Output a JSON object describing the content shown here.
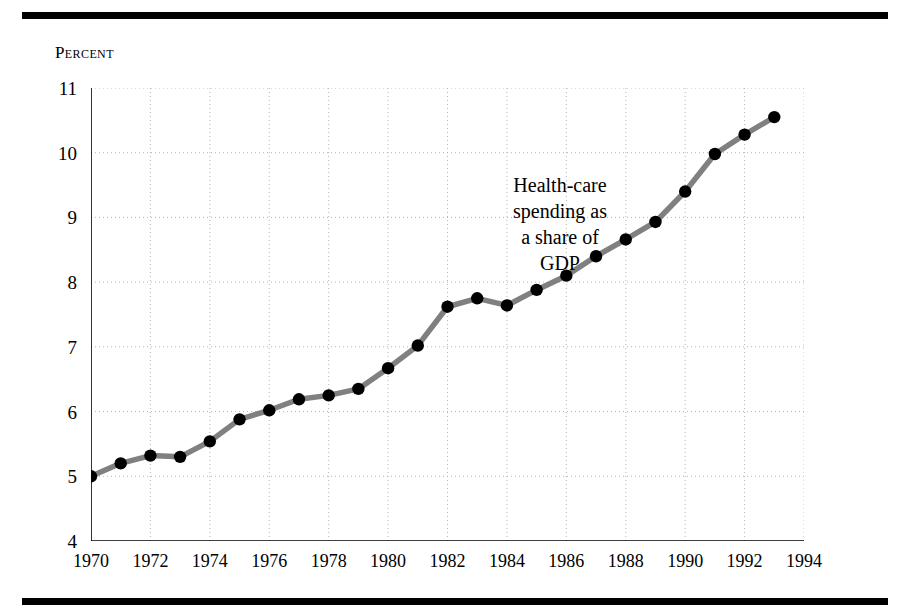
{
  "chart_data": {
    "type": "line",
    "title": "",
    "ylabel": "Percent",
    "xlabel": "",
    "xlim": [
      1970,
      1994
    ],
    "ylim": [
      4,
      11
    ],
    "yticks": [
      4,
      5,
      6,
      7,
      8,
      9,
      10,
      11
    ],
    "xticks": [
      1970,
      1972,
      1974,
      1976,
      1978,
      1980,
      1982,
      1984,
      1986,
      1988,
      1990,
      1992,
      1994
    ],
    "minor_x_tick_interval": 1,
    "grid": true,
    "grid_style": "dotted",
    "legend": "none",
    "annotations": [
      {
        "lines": [
          "Health-care",
          "spending as",
          "a share of",
          "GDP"
        ],
        "x": 1985,
        "y": 9.2
      }
    ],
    "series": [
      {
        "name": "Health-care spending as a share of GDP",
        "line_color": "#808080",
        "marker_color": "#000000",
        "x": [
          1970,
          1971,
          1972,
          1973,
          1974,
          1975,
          1976,
          1977,
          1978,
          1979,
          1980,
          1981,
          1982,
          1983,
          1984,
          1985,
          1986,
          1987,
          1988,
          1989,
          1990,
          1991,
          1992,
          1993
        ],
        "values": [
          5.0,
          5.2,
          5.32,
          5.3,
          5.54,
          5.88,
          6.02,
          6.19,
          6.25,
          6.35,
          6.67,
          7.02,
          7.62,
          7.75,
          7.64,
          7.88,
          8.1,
          8.4,
          8.66,
          8.93,
          9.4,
          9.98,
          10.28,
          10.55
        ]
      }
    ]
  },
  "axis": {
    "caption": "Percent",
    "y_labels": [
      "11",
      "10",
      "9",
      "8",
      "7",
      "6",
      "5",
      "4"
    ],
    "x_labels": [
      "1970",
      "1972",
      "1974",
      "1976",
      "1978",
      "1980",
      "1982",
      "1984",
      "1986",
      "1988",
      "1990",
      "1992",
      "1994"
    ]
  },
  "annotation": {
    "line1": "Health-care",
    "line2": "spending as",
    "line3": "a share of",
    "line4": "GDP"
  },
  "colors": {
    "line": "#808080",
    "marker": "#000000",
    "grid": "#b4b4b4",
    "axis": "#000000",
    "rule": "#000000",
    "background": "#ffffff"
  }
}
